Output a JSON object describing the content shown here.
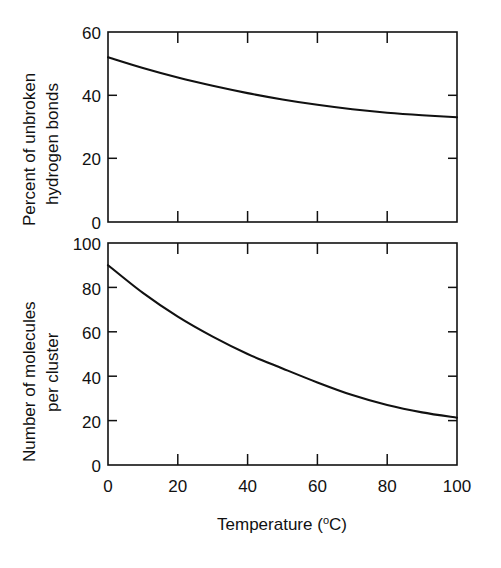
{
  "chart_data": [
    {
      "type": "line",
      "panel": "top",
      "title": "",
      "xlabel": "Temperature (°C)",
      "ylabel": "Percent of unbroken hydrogen bonds",
      "ylabel_lines": [
        "Percent of unbroken",
        "hydrogen bonds"
      ],
      "xlim": [
        0,
        100
      ],
      "ylim": [
        0,
        60
      ],
      "xticks": [
        0,
        20,
        40,
        60,
        80,
        100
      ],
      "yticks": [
        0,
        20,
        40,
        60
      ],
      "xtick_labels": [
        "0",
        "20",
        "40",
        "60",
        "80",
        "100"
      ],
      "ytick_labels": [
        "0",
        "20",
        "40",
        "60"
      ],
      "grid": false,
      "legend": false,
      "x": [
        0,
        10,
        20,
        30,
        40,
        50,
        60,
        70,
        80,
        90,
        100
      ],
      "values": [
        52.0,
        48.6,
        45.6,
        43.0,
        40.7,
        38.7,
        37.0,
        35.6,
        34.5,
        33.7,
        33.1
      ],
      "series": [
        {
          "name": "Percent of unbroken hydrogen bonds",
          "values": [
            52.0,
            48.6,
            45.6,
            43.0,
            40.7,
            38.7,
            37.0,
            35.6,
            34.5,
            33.7,
            33.1
          ]
        }
      ]
    },
    {
      "type": "line",
      "panel": "bottom",
      "title": "",
      "xlabel": "Temperature (°C)",
      "ylabel": "Number of molecules per cluster",
      "ylabel_lines": [
        "Number of molecules",
        "per cluster"
      ],
      "xlim": [
        0,
        100
      ],
      "ylim": [
        0,
        100
      ],
      "xticks": [
        0,
        20,
        40,
        60,
        80,
        100
      ],
      "yticks": [
        0,
        20,
        40,
        60,
        80,
        100
      ],
      "xtick_labels": [
        "0",
        "20",
        "40",
        "60",
        "80",
        "100"
      ],
      "ytick_labels": [
        "0",
        "20",
        "40",
        "60",
        "80",
        "100"
      ],
      "grid": false,
      "legend": false,
      "x": [
        0,
        10,
        20,
        30,
        40,
        50,
        60,
        70,
        80,
        90,
        100
      ],
      "values": [
        90.0,
        77.5,
        66.8,
        57.8,
        50.0,
        43.5,
        37.2,
        31.5,
        27.0,
        23.7,
        21.3
      ],
      "series": [
        {
          "name": "Number of molecules per cluster",
          "values": [
            90.0,
            77.5,
            66.8,
            57.8,
            50.0,
            43.5,
            37.2,
            31.5,
            27.0,
            23.7,
            21.3
          ]
        }
      ]
    }
  ],
  "figure": {
    "background_color": "#ffffff",
    "ink_color": "#111111",
    "x_axis_title": "Temperature (",
    "x_axis_title_sup": "o",
    "x_axis_title_tail": "C)"
  },
  "top_panel": {
    "ylabel_line1": "Percent of unbroken",
    "ylabel_line2": "hydrogen bonds",
    "ytick_0": "0",
    "ytick_1": "20",
    "ytick_2": "40",
    "ytick_3": "60"
  },
  "bottom_panel": {
    "ylabel_line1": "Number of molecules",
    "ylabel_line2": "per cluster",
    "ytick_0": "0",
    "ytick_1": "20",
    "ytick_2": "40",
    "ytick_3": "60",
    "ytick_4": "80",
    "ytick_5": "100",
    "xtick_0": "0",
    "xtick_1": "20",
    "xtick_2": "40",
    "xtick_3": "60",
    "xtick_4": "80",
    "xtick_5": "100"
  }
}
